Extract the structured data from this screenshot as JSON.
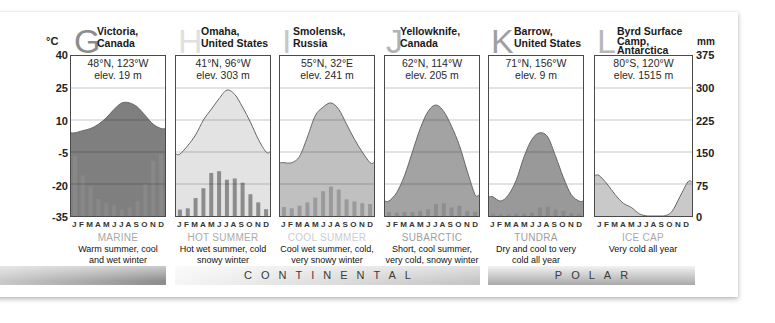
{
  "axes": {
    "left_unit": "°C",
    "left_ticks": [
      "40",
      "25",
      "10",
      "-5",
      "-20",
      "-35"
    ],
    "right_unit": "mm",
    "right_ticks": [
      "375",
      "300",
      "225",
      "150",
      "75",
      "0"
    ]
  },
  "months_label": "J F M A M J J A S O N D",
  "stations": [
    {
      "letter": "G",
      "name_line1": "Victoria,",
      "name_line2": "Canada",
      "name_line3": "",
      "coords": "48°N, 123°W",
      "elev": "elev. 19 m",
      "type": "MARINE",
      "desc_line1": "Warm summer, cool",
      "desc_line2": "and wet winter",
      "letter_color": "#8c8c8c",
      "type_color": "#a8a8a8"
    },
    {
      "letter": "H",
      "name_line1": "Omaha,",
      "name_line2": "United States",
      "name_line3": "",
      "coords": "41°N, 96°W",
      "elev": "elev. 303 m",
      "type": "HOT SUMMER",
      "desc_line1": "Hot wet summer, cold",
      "desc_line2": "snowy winter",
      "letter_color": "#e0e0e0",
      "type_color": "#aaaaaa"
    },
    {
      "letter": "I",
      "name_line1": "Smolensk,",
      "name_line2": "Russia",
      "name_line3": "",
      "coords": "55°N, 32°E",
      "elev": "elev. 241 m",
      "type": "COOL SUMMER",
      "desc_line1": "Cool wet summer, cold,",
      "desc_line2": "very snowy winter",
      "letter_color": "#c8c8c8",
      "type_color": "#cccccc"
    },
    {
      "letter": "J",
      "name_line1": "Yellowknife,",
      "name_line2": "Canada",
      "name_line3": "",
      "coords": "62°N, 114°W",
      "elev": "elev. 205 m",
      "type": "SUBARCTIC",
      "desc_line1": "Short, cool summer,",
      "desc_line2": "very cold, snowy winter",
      "letter_color": "#b2b2b2",
      "type_color": "#9e9e9e"
    },
    {
      "letter": "K",
      "name_line1": "Barrow,",
      "name_line2": "United States",
      "name_line3": "",
      "coords": "71°N, 156°W",
      "elev": "elev. 9 m",
      "type": "TUNDRA",
      "desc_line1": "Dry and cool to very",
      "desc_line2": "cold all year",
      "letter_color": "#a0a0a0",
      "type_color": "#9e9e9e"
    },
    {
      "letter": "L",
      "name_line1": "Byrd Surface",
      "name_line2": "Camp,",
      "name_line3": "Antarctica",
      "coords": "80°S, 120°W",
      "elev": "elev. 1515 m",
      "type": "ICE CAP",
      "desc_line1": "Very cold all year",
      "desc_line2": "",
      "letter_color": "#b8b8b8",
      "type_color": "#aaaaaa"
    }
  ],
  "groups": {
    "marine": "",
    "continental": "CONTINENTAL",
    "polar": "POLAR"
  },
  "colors": {
    "fills": [
      "#7f7f7f",
      "#e3e3e3",
      "#c0c0c0",
      "#a3a3a3",
      "#999999",
      "#c9c9c9"
    ],
    "bars": [
      "#888888",
      "#8c8c8c",
      "#9a9a9a",
      "#8e8e8e",
      "#8a8a8a",
      "#8a8a8a"
    ],
    "temp_line": "#666666",
    "grid": "rgba(0,0,0,0.22)"
  },
  "chart_data": [
    {
      "type": "area+bar",
      "title": "G Victoria, Canada — MARINE",
      "categories": [
        "J",
        "F",
        "M",
        "A",
        "M",
        "J",
        "J",
        "A",
        "S",
        "O",
        "N",
        "D"
      ],
      "series": [
        {
          "name": "Temperature (°C)",
          "type": "area",
          "values": [
            4,
            5,
            6,
            8,
            11,
            15,
            18,
            18,
            16,
            12,
            8,
            6
          ]
        },
        {
          "name": "Precipitation (mm)",
          "type": "bar",
          "values": [
            140,
            95,
            70,
            40,
            30,
            25,
            15,
            20,
            35,
            75,
            130,
            145
          ]
        }
      ],
      "ylim_left": [
        -35,
        40
      ],
      "ylim_right": [
        0,
        375
      ],
      "grid": true
    },
    {
      "type": "area+bar",
      "title": "H Omaha, United States — HOT SUMMER",
      "categories": [
        "J",
        "F",
        "M",
        "A",
        "M",
        "J",
        "J",
        "A",
        "S",
        "O",
        "N",
        "D"
      ],
      "series": [
        {
          "name": "Temperature (°C)",
          "type": "area",
          "values": [
            -6,
            -2,
            3,
            10,
            15,
            20,
            24,
            22,
            16,
            9,
            1,
            -5
          ]
        },
        {
          "name": "Precipitation (mm)",
          "type": "bar",
          "values": [
            15,
            18,
            42,
            65,
            101,
            105,
            85,
            88,
            78,
            51,
            32,
            16
          ]
        }
      ],
      "ylim_left": [
        -35,
        40
      ],
      "ylim_right": [
        0,
        375
      ],
      "grid": true
    },
    {
      "type": "area+bar",
      "title": "I Smolensk, Russia — COOL SUMMER",
      "categories": [
        "J",
        "F",
        "M",
        "A",
        "M",
        "J",
        "J",
        "A",
        "S",
        "O",
        "N",
        "D"
      ],
      "series": [
        {
          "name": "Temperature (°C)",
          "type": "area",
          "values": [
            -10,
            -10,
            -7,
            2,
            12,
            16,
            18,
            15,
            8,
            1,
            -5,
            -10
          ]
        },
        {
          "name": "Precipitation (mm)",
          "type": "bar",
          "values": [
            21,
            18,
            24,
            32,
            43,
            58,
            69,
            62,
            39,
            34,
            30,
            28
          ]
        }
      ],
      "ylim_left": [
        -35,
        40
      ],
      "ylim_right": [
        0,
        375
      ],
      "grid": true
    },
    {
      "type": "area+bar",
      "title": "J Yellowknife, Canada — SUBARCTIC",
      "categories": [
        "J",
        "F",
        "M",
        "A",
        "M",
        "J",
        "J",
        "A",
        "S",
        "O",
        "N",
        "D"
      ],
      "series": [
        {
          "name": "Temperature (°C)",
          "type": "area",
          "values": [
            -28,
            -24,
            -16,
            -5,
            6,
            14,
            17,
            14,
            7,
            -2,
            -14,
            -25
          ]
        },
        {
          "name": "Precipitation (mm)",
          "type": "bar",
          "values": [
            9,
            8,
            9,
            9,
            12,
            16,
            28,
            30,
            20,
            24,
            12,
            10
          ]
        }
      ],
      "ylim_left": [
        -35,
        40
      ],
      "ylim_right": [
        0,
        375
      ],
      "grid": true
    },
    {
      "type": "area+bar",
      "title": "K Barrow, United States — TUNDRA",
      "categories": [
        "J",
        "F",
        "M",
        "A",
        "M",
        "J",
        "J",
        "A",
        "S",
        "O",
        "N",
        "D"
      ],
      "series": [
        {
          "name": "Temperature (°C)",
          "type": "area",
          "values": [
            -26,
            -28,
            -25,
            -18,
            -7,
            1,
            4,
            2,
            -7,
            -17,
            -25,
            -28
          ]
        },
        {
          "name": "Precipitation (mm)",
          "type": "bar",
          "values": [
            5,
            4,
            4,
            5,
            5,
            8,
            20,
            22,
            15,
            12,
            6,
            5
          ]
        }
      ],
      "ylim_left": [
        -35,
        40
      ],
      "ylim_right": [
        0,
        375
      ],
      "grid": true
    },
    {
      "type": "area+bar",
      "title": "L Byrd Surface Camp, Antarctica — ICE CAP",
      "categories": [
        "J",
        "F",
        "M",
        "A",
        "M",
        "J",
        "J",
        "A",
        "S",
        "O",
        "N",
        "D"
      ],
      "series": [
        {
          "name": "Temperature (°C)",
          "type": "area",
          "values": [
            -16,
            -20,
            -25,
            -29,
            -31,
            -34,
            -35,
            -35,
            -35,
            -33,
            -26,
            -19
          ]
        },
        {
          "name": "Precipitation (mm)",
          "type": "bar",
          "values": [
            0,
            0,
            0,
            0,
            0,
            0,
            0,
            0,
            0,
            0,
            0,
            0
          ]
        }
      ],
      "ylim_left": [
        -35,
        40
      ],
      "ylim_right": [
        0,
        375
      ],
      "grid": true
    }
  ]
}
